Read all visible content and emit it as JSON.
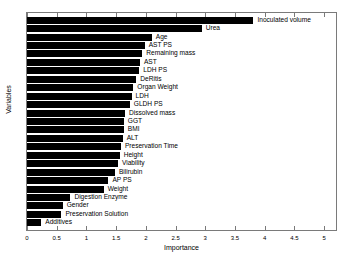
{
  "chart_data": {
    "type": "bar",
    "orientation": "horizontal",
    "title": "",
    "xlabel": "Importance",
    "ylabel": "Variables",
    "xlim": [
      0,
      5.2
    ],
    "grid": false,
    "legend": "none",
    "xticks": [
      "0",
      "0.5",
      "1",
      "1.5",
      "2",
      "2.5",
      "3",
      "3.5",
      "4",
      "4.5",
      "5"
    ],
    "xtick_values": [
      0,
      0.5,
      1,
      1.5,
      2,
      2.5,
      3,
      3.5,
      4,
      4.5,
      5
    ],
    "categories": [
      "Inoculated volume",
      "Urea",
      "Age",
      "AST PS",
      "Remaining mass",
      "AST",
      "LDH PS",
      "DeRitis",
      "Organ Weight",
      "LDH",
      "GLDH PS",
      "Dissolved mass",
      "GGT",
      "BMI",
      "ALT",
      "Preservation Time",
      "Height",
      "Viability",
      "Bilirubin",
      "AP PS",
      "Weight",
      "Digestion Enzyme",
      "Gender",
      "Preservation Solution",
      "Additives"
    ],
    "values": [
      3.81,
      2.94,
      2.1,
      1.98,
      1.94,
      1.9,
      1.89,
      1.84,
      1.79,
      1.76,
      1.73,
      1.65,
      1.63,
      1.63,
      1.61,
      1.58,
      1.56,
      1.53,
      1.48,
      1.37,
      1.29,
      0.73,
      0.6,
      0.58,
      0.24
    ],
    "bar_color": "#000000"
  }
}
